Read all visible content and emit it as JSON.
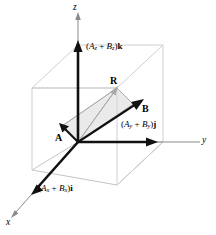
{
  "figure": {
    "background_color": "#ffffff",
    "axis_color": "#8a8a8a",
    "box_color": "#c9c9c9",
    "vector_color": "#111111",
    "plane_fill_color": "#d8d8d8"
  },
  "axes": [
    {
      "name": "z",
      "label": "z",
      "direction": "up"
    },
    {
      "name": "y",
      "label": "y",
      "direction": "right"
    },
    {
      "name": "x",
      "label": "x",
      "direction": "down-left"
    }
  ],
  "vectors": [
    {
      "name": "R",
      "label": "R",
      "description": "resultant vector"
    },
    {
      "name": "A",
      "label": "A",
      "description": "first addend vector"
    },
    {
      "name": "B",
      "label": "B",
      "description": "second addend vector"
    }
  ],
  "components": {
    "z": {
      "open": "(",
      "first_symbol": "A",
      "first_sub": "z",
      "plus": " + ",
      "second_symbol": "B",
      "second_sub": "z",
      "close": ")",
      "unit_vector": "k"
    },
    "y": {
      "open": "(",
      "first_symbol": "A",
      "first_sub": "y",
      "plus": " + ",
      "second_symbol": "B",
      "second_sub": "y",
      "close": ")",
      "unit_vector": "j"
    },
    "x": {
      "open": "(",
      "first_symbol": "A",
      "first_sub": "x",
      "plus": " + ",
      "second_symbol": "B",
      "second_sub": "x",
      "close": ")",
      "unit_vector": "i"
    }
  }
}
